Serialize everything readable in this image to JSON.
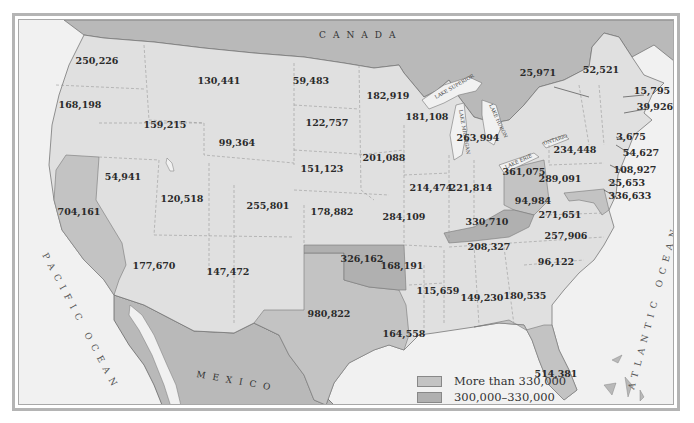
{
  "colors": {
    "water": "#f1f1f1",
    "foreign_land": "#b9b9b9",
    "less_than_300k": "#e0e0e0",
    "between_300k_330k": "#b0b0b0",
    "more_than_330k": "#c3c3c3",
    "border": "#8a8a8a",
    "text": "#2a2a2a"
  },
  "labels": {
    "canada": "CANADA",
    "mexico": "MEXICO",
    "pacific": "PACIFIC OCEAN",
    "atlantic": "ATLANTIC OCEAN",
    "lake_superior": "LAKE SUPERIOR",
    "lake_michigan": "LAKE MICHIGAN",
    "lake_huron": "LAKE HURON",
    "lake_erie": "LAKE ERIE",
    "lake_ontario": "ONTARIO"
  },
  "legend": [
    {
      "label": "More than 330,000",
      "color": "#c3c3c3"
    },
    {
      "label": "300,000–330,000",
      "color": "#b0b0b0"
    },
    {
      "label": "Less than 300,000",
      "color": "#e0e0e0"
    }
  ],
  "states": [
    {
      "name": "Washington",
      "value": "250,226",
      "x": 93,
      "y": 59
    },
    {
      "name": "Oregon",
      "value": "168,198",
      "x": 76,
      "y": 103
    },
    {
      "name": "Idaho",
      "value": "159,215",
      "x": 161,
      "y": 123
    },
    {
      "name": "Montana",
      "value": "130,441",
      "x": 215,
      "y": 79
    },
    {
      "name": "Wyoming",
      "value": "99,364",
      "x": 233,
      "y": 141
    },
    {
      "name": "North Dakota",
      "value": "59,483",
      "x": 307,
      "y": 79
    },
    {
      "name": "South Dakota",
      "value": "122,757",
      "x": 323,
      "y": 121
    },
    {
      "name": "Minnesota",
      "value": "182,919",
      "x": 384,
      "y": 94
    },
    {
      "name": "Wisconsin",
      "value": "181,108",
      "x": 423,
      "y": 115
    },
    {
      "name": "Michigan",
      "value": "263,994",
      "x": 474,
      "y": 136
    },
    {
      "name": "Nevada",
      "value": "54,941",
      "x": 119,
      "y": 175
    },
    {
      "name": "Utah",
      "value": "120,518",
      "x": 178,
      "y": 197
    },
    {
      "name": "Colorado",
      "value": "255,801",
      "x": 264,
      "y": 204
    },
    {
      "name": "Nebraska",
      "value": "151,123",
      "x": 318,
      "y": 167
    },
    {
      "name": "Iowa",
      "value": "201,088",
      "x": 380,
      "y": 156
    },
    {
      "name": "Illinois",
      "value": "214,474",
      "x": 427,
      "y": 186
    },
    {
      "name": "Indiana",
      "value": "221,814",
      "x": 467,
      "y": 186
    },
    {
      "name": "Ohio",
      "value": "361,075",
      "x": 520,
      "y": 170
    },
    {
      "name": "California",
      "value": "704,161",
      "x": 75,
      "y": 210
    },
    {
      "name": "Kansas",
      "value": "178,882",
      "x": 328,
      "y": 210
    },
    {
      "name": "Missouri",
      "value": "284,109",
      "x": 400,
      "y": 215
    },
    {
      "name": "Kentucky",
      "value": "330,710",
      "x": 483,
      "y": 220
    },
    {
      "name": "West Virginia",
      "value": "94,984",
      "x": 529,
      "y": 199
    },
    {
      "name": "Virginia",
      "value": "271,651",
      "x": 556,
      "y": 213
    },
    {
      "name": "Arizona",
      "value": "177,670",
      "x": 150,
      "y": 264
    },
    {
      "name": "New Mexico",
      "value": "147,472",
      "x": 224,
      "y": 270
    },
    {
      "name": "Oklahoma",
      "value": "326,162",
      "x": 358,
      "y": 257
    },
    {
      "name": "Arkansas",
      "value": "168,191",
      "x": 398,
      "y": 264
    },
    {
      "name": "Tennessee",
      "value": "208,327",
      "x": 485,
      "y": 245
    },
    {
      "name": "North Carolina",
      "value": "257,906",
      "x": 562,
      "y": 234
    },
    {
      "name": "South Carolina",
      "value": "96,122",
      "x": 552,
      "y": 260
    },
    {
      "name": "Texas",
      "value": "980,822",
      "x": 325,
      "y": 312
    },
    {
      "name": "Mississippi",
      "value": "115,659",
      "x": 434,
      "y": 289
    },
    {
      "name": "Alabama",
      "value": "149,230",
      "x": 478,
      "y": 296
    },
    {
      "name": "Georgia",
      "value": "180,535",
      "x": 521,
      "y": 294
    },
    {
      "name": "Louisiana",
      "value": "164,558",
      "x": 400,
      "y": 332
    },
    {
      "name": "Florida",
      "value": "514,381",
      "x": 552,
      "y": 372
    },
    {
      "name": "New York",
      "value": "234,448",
      "x": 571,
      "y": 148
    },
    {
      "name": "Pennsylvania",
      "value": "289,091",
      "x": 556,
      "y": 177
    },
    {
      "name": "Vermont",
      "value": "25,971",
      "x": 534,
      "y": 71
    },
    {
      "name": "Maine",
      "value": "52,521",
      "x": 597,
      "y": 68
    },
    {
      "name": "New Hampshire",
      "value": "15,795",
      "x": 648,
      "y": 89
    },
    {
      "name": "Massachusetts",
      "value": "39,926",
      "x": 651,
      "y": 105
    },
    {
      "name": "Rhode Island",
      "value": "3,675",
      "x": 627,
      "y": 135
    },
    {
      "name": "Connecticut",
      "value": "54,627",
      "x": 637,
      "y": 151
    },
    {
      "name": "New Jersey",
      "value": "108,927",
      "x": 631,
      "y": 168
    },
    {
      "name": "Delaware",
      "value": "25,653",
      "x": 623,
      "y": 181
    },
    {
      "name": "Maryland",
      "value": "336,633",
      "x": 626,
      "y": 194
    }
  ]
}
